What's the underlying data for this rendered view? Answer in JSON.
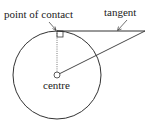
{
  "diagram": {
    "type": "geometry",
    "labels": {
      "point_of_contact": "point of contact",
      "tangent": "tangent",
      "centre": "centre"
    },
    "colors": {
      "stroke": "#333333",
      "radius_dotted": "#555555",
      "text": "#222222"
    },
    "elements": {
      "circle": {
        "cx": 57,
        "cy": 75,
        "r": 44
      },
      "tangent_line": {
        "x1": 57,
        "y1": 31,
        "x2": 145,
        "y2": 31
      },
      "radius_to_contact": {
        "x1": 57,
        "y1": 31,
        "x2": 57,
        "y2": 75,
        "style": "dotted"
      },
      "line_centre_to_external_point": {
        "x1": 57,
        "y1": 75,
        "x2": 145,
        "y2": 31
      },
      "right_angle_marker": {
        "x": 57,
        "y": 31,
        "size": 6
      },
      "centre_marker": {
        "cx": 57,
        "cy": 75,
        "r": 3
      }
    }
  }
}
